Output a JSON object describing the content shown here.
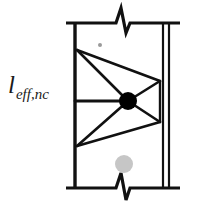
{
  "figure": {
    "name": "effective-length-strut-and-tie-column-diagram",
    "background_color": "#ffffff",
    "line_color": "#111111",
    "node_color": "#000000",
    "grey_marker_color": "#c6c6c6",
    "speck_color": "#9a9a9a",
    "width": 201,
    "height": 208,
    "labels": {
      "effective_length_symbol": "l",
      "effective_length_subscript": "eff,nc"
    },
    "elements": {
      "column_left_edge": "column-left-edge-line",
      "column_right_edge_inner": "column-right-edge-inner-line",
      "column_right_edge_outer": "column-right-edge-outer-line",
      "top_boundary": "top-boundary-line-with-break",
      "bottom_boundary": "bottom-boundary-line-with-break",
      "top_break_symbol": "top-break-zigzag",
      "bottom_break_symbol": "bottom-break-zigzag",
      "center_node": "center-node-dot",
      "tie_horizontal": "horizontal-tie-line",
      "struts": [
        "strut-upper-left-to-node",
        "strut-upper-left-to-upper-right",
        "strut-upper-right-to-node",
        "strut-node-to-lower-right",
        "strut-lower-right-to-lower-left",
        "strut-lower-left-to-node"
      ],
      "grey_marker": "grey-concrete-marker",
      "grey_speck": "grey-speck-marker"
    },
    "geometry": {
      "column_left_x": 74,
      "column_right_inner_x": 161,
      "column_right_outer_x": 168,
      "top_y": 23,
      "bottom_y": 188,
      "node_x": 128,
      "node_y": 101,
      "node_radius": 9,
      "truss_top_left": [
        77,
        50
      ],
      "truss_bottom_left": [
        77,
        146
      ],
      "truss_top_right": [
        160,
        81
      ],
      "truss_bottom_right": [
        160,
        122
      ],
      "grey_marker_center": [
        124,
        164
      ],
      "grey_marker_radius": 9,
      "speck_center": [
        100,
        45
      ],
      "speck_radius": 2
    }
  }
}
